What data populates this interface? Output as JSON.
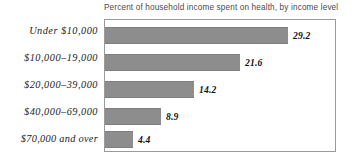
{
  "chart_data": {
    "type": "bar",
    "orientation": "horizontal",
    "title": "Percent of household income spent on health, by income level",
    "xlabel": "",
    "ylabel": "",
    "categories": [
      "Under $10,000",
      "$10,000–19,000",
      "$20,000–39,000",
      "$40,000–69,000",
      "$70,000 and over"
    ],
    "values": [
      29.2,
      21.6,
      14.2,
      8.9,
      4.4
    ],
    "value_labels": [
      "29.2",
      "21.6",
      "14.2",
      "8.9",
      "4.4"
    ],
    "xlim": [
      0,
      36.8
    ],
    "grid": false,
    "legend": false,
    "bar_color": "#8d8d8d",
    "border_color": "#9a9a9a",
    "title_color": "#4a4a4a",
    "label_color": "#1b1b1b"
  }
}
